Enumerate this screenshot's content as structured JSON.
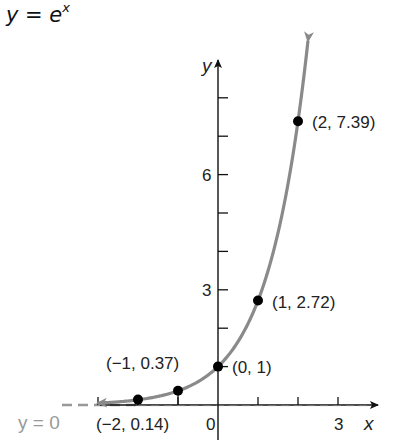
{
  "chart_data": {
    "type": "line",
    "title_base": "y = e",
    "title_exp": "x",
    "xlabel": "x",
    "ylabel": "y",
    "xlim": [
      -5.3,
      4
    ],
    "ylim": [
      -1,
      8.5
    ],
    "x_tick_values": [
      -3,
      -2,
      -1,
      1,
      2,
      3
    ],
    "x_tick_labels": [
      {
        "value": 0,
        "text": "0"
      },
      {
        "value": 3,
        "text": "3"
      }
    ],
    "y_tick_values": [
      1,
      2,
      3,
      4,
      5,
      6,
      7,
      8
    ],
    "y_tick_labels": [
      {
        "value": 3,
        "text": "3"
      },
      {
        "value": 6,
        "text": "6"
      }
    ],
    "curve": {
      "function": "exp",
      "x_range": [
        -3,
        2.25
      ],
      "color": "#8a8a8a"
    },
    "asymptote": {
      "label": "y = 0",
      "color": "#999999"
    },
    "points": [
      {
        "x": -2,
        "y": 0.14,
        "label": "(−2, 0.14)"
      },
      {
        "x": -1,
        "y": 0.37,
        "label": "(−1, 0.37)"
      },
      {
        "x": 0,
        "y": 1,
        "label": "(0, 1)"
      },
      {
        "x": 1,
        "y": 2.72,
        "label": "(1, 2.72)"
      },
      {
        "x": 2,
        "y": 7.39,
        "label": "(2, 7.39)"
      }
    ],
    "grid": false,
    "legend": "none"
  }
}
